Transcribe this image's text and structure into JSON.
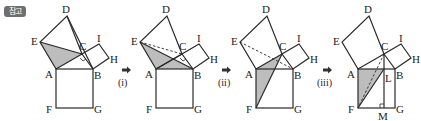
{
  "badge": {
    "label": "참고"
  },
  "colors": {
    "stroke": "#2a2a2a",
    "shade": "#bdbdbd",
    "badge_bg": "#6f6f6f"
  },
  "panels": [
    {
      "id": "panel-1",
      "points": [
        "A",
        "B",
        "C",
        "D",
        "E",
        "F",
        "G",
        "H",
        "I"
      ],
      "shaded": "triangle EAC"
    },
    {
      "id": "panel-2",
      "step_label": "(i)",
      "points": [
        "A",
        "B",
        "C",
        "D",
        "E",
        "F",
        "G",
        "H",
        "I"
      ],
      "shaded": "triangle EAB",
      "dashed": "EC"
    },
    {
      "id": "panel-3",
      "step_label": "(ii)",
      "points": [
        "A",
        "B",
        "C",
        "D",
        "E",
        "F",
        "G",
        "H",
        "I"
      ],
      "shaded": "triangle CAF",
      "dashed": "EB"
    },
    {
      "id": "panel-4",
      "step_label": "(iii)",
      "points": [
        "A",
        "B",
        "C",
        "D",
        "E",
        "F",
        "G",
        "H",
        "I",
        "L",
        "M"
      ],
      "shaded": "triangle LAF",
      "dashed": "CF"
    }
  ],
  "labels": {
    "A": "A",
    "B": "B",
    "C": "C",
    "D": "D",
    "E": "E",
    "F": "F",
    "G": "G",
    "H": "H",
    "I": "I",
    "L": "L",
    "M": "M"
  },
  "steps": {
    "s1": "(i)",
    "s2": "(ii)",
    "s3": "(iii)"
  },
  "arrow_glyph": "➡"
}
